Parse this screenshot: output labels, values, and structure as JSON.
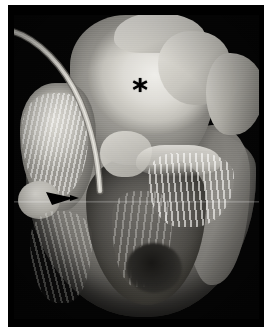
{
  "figure": {
    "kind": "gross-pathology-photograph",
    "modality": "grayscale photograph",
    "background_color": "#050505",
    "page_color": "#ffffff",
    "width_px": 268,
    "height_px": 333
  },
  "plate": {
    "left_px": 8,
    "top_px": 5,
    "width_px": 256,
    "height_px": 322
  },
  "annotations": [
    {
      "id": "asterisk",
      "symbol": "✳",
      "glyph": "*",
      "color": "#000000",
      "x_px": 140,
      "y_px": 95,
      "points_to": "bright fibrous valvular region in the upper chamber"
    },
    {
      "id": "arrow",
      "symbol": "▶",
      "color": "#000000",
      "x_px": 63,
      "y_px": 198,
      "direction": "right",
      "points_to": "structure at the base of the left atrial region"
    }
  ],
  "specimen_regions": [
    {
      "id": "fibrous-mass",
      "label": "Upper fibrous / valvular tissue",
      "tone": "bright white-grey"
    },
    {
      "id": "left-atrium",
      "label": "Left atrial wall with pectinate strands",
      "tone": "light grey"
    },
    {
      "id": "ventricular-mass",
      "label": "Ventricular myocardial mass",
      "tone": "mid grey"
    },
    {
      "id": "lv-cavity",
      "label": "Ventricular cavity",
      "tone": "dark grey"
    },
    {
      "id": "rv-wall",
      "label": "Right free wall",
      "tone": "mid grey"
    },
    {
      "id": "chordae-right",
      "label": "Chordae tendineae",
      "tone": "white streaks"
    },
    {
      "id": "papillary-shadow",
      "label": "Papillary muscle recess",
      "tone": "near black"
    },
    {
      "id": "catheter",
      "label": "Cannula / probe tube",
      "tone": "pale grey"
    }
  ],
  "catheter": {
    "stroke_color": "#c9c7c0",
    "shadow_color": "#6d6b66",
    "path": "M 4 26 C 30 34, 56 60, 72 96 C 84 124, 90 152, 92 186",
    "width_px": 5
  },
  "scanline": {
    "y_px": 196,
    "height_px": 2,
    "description": "horizontal scan artifact across the photograph"
  }
}
